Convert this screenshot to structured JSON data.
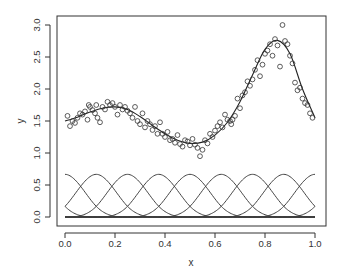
{
  "chart_data": {
    "type": "scatter",
    "title": "",
    "xlabel": "x",
    "ylabel": "y",
    "xlim": [
      -0.03,
      1.04
    ],
    "ylim": [
      -0.14,
      3.14
    ],
    "grid": false,
    "legend": null,
    "x_ticks": [
      "0.0",
      "0.2",
      "0.4",
      "0.6",
      "0.8",
      "1.0"
    ],
    "y_ticks": [
      "0.0",
      "0.5",
      "1.0",
      "1.5",
      "2.0",
      "2.5",
      "3.0"
    ],
    "points": [
      [
        0.01,
        1.58
      ],
      [
        0.02,
        1.42
      ],
      [
        0.03,
        1.5
      ],
      [
        0.04,
        1.47
      ],
      [
        0.05,
        1.55
      ],
      [
        0.06,
        1.62
      ],
      [
        0.07,
        1.6
      ],
      [
        0.08,
        1.65
      ],
      [
        0.09,
        1.52
      ],
      [
        0.095,
        1.75
      ],
      [
        0.1,
        1.72
      ],
      [
        0.11,
        1.67
      ],
      [
        0.12,
        1.62
      ],
      [
        0.125,
        1.75
      ],
      [
        0.13,
        1.55
      ],
      [
        0.14,
        1.48
      ],
      [
        0.15,
        1.72
      ],
      [
        0.16,
        1.68
      ],
      [
        0.17,
        1.8
      ],
      [
        0.18,
        1.75
      ],
      [
        0.19,
        1.78
      ],
      [
        0.2,
        1.72
      ],
      [
        0.21,
        1.6
      ],
      [
        0.22,
        1.75
      ],
      [
        0.23,
        1.68
      ],
      [
        0.24,
        1.72
      ],
      [
        0.25,
        1.66
      ],
      [
        0.26,
        1.62
      ],
      [
        0.27,
        1.55
      ],
      [
        0.28,
        1.72
      ],
      [
        0.29,
        1.5
      ],
      [
        0.3,
        1.45
      ],
      [
        0.31,
        1.62
      ],
      [
        0.32,
        1.4
      ],
      [
        0.33,
        1.5
      ],
      [
        0.34,
        1.45
      ],
      [
        0.35,
        1.36
      ],
      [
        0.36,
        1.42
      ],
      [
        0.37,
        1.3
      ],
      [
        0.38,
        1.48
      ],
      [
        0.39,
        1.3
      ],
      [
        0.4,
        1.25
      ],
      [
        0.41,
        1.33
      ],
      [
        0.42,
        1.2
      ],
      [
        0.43,
        1.22
      ],
      [
        0.44,
        1.16
      ],
      [
        0.45,
        1.28
      ],
      [
        0.46,
        1.14
      ],
      [
        0.47,
        1.1
      ],
      [
        0.48,
        1.2
      ],
      [
        0.49,
        1.18
      ],
      [
        0.5,
        1.12
      ],
      [
        0.51,
        1.22
      ],
      [
        0.52,
        1.13
      ],
      [
        0.53,
        1.08
      ],
      [
        0.54,
        0.95
      ],
      [
        0.55,
        1.05
      ],
      [
        0.56,
        1.2
      ],
      [
        0.57,
        1.15
      ],
      [
        0.58,
        1.3
      ],
      [
        0.59,
        1.25
      ],
      [
        0.6,
        1.35
      ],
      [
        0.61,
        1.42
      ],
      [
        0.62,
        1.48
      ],
      [
        0.63,
        1.4
      ],
      [
        0.64,
        1.6
      ],
      [
        0.65,
        1.52
      ],
      [
        0.66,
        1.5
      ],
      [
        0.665,
        1.45
      ],
      [
        0.67,
        1.52
      ],
      [
        0.68,
        1.58
      ],
      [
        0.69,
        1.85
      ],
      [
        0.7,
        1.7
      ],
      [
        0.71,
        1.9
      ],
      [
        0.72,
        1.95
      ],
      [
        0.73,
        2.12
      ],
      [
        0.74,
        2.05
      ],
      [
        0.75,
        2.15
      ],
      [
        0.76,
        2.3
      ],
      [
        0.77,
        2.45
      ],
      [
        0.78,
        2.2
      ],
      [
        0.79,
        2.38
      ],
      [
        0.8,
        2.55
      ],
      [
        0.81,
        2.6
      ],
      [
        0.82,
        2.7
      ],
      [
        0.83,
        2.52
      ],
      [
        0.84,
        2.78
      ],
      [
        0.85,
        2.68
      ],
      [
        0.86,
        2.35
      ],
      [
        0.87,
        3.0
      ],
      [
        0.88,
        2.75
      ],
      [
        0.89,
        2.7
      ],
      [
        0.9,
        2.52
      ],
      [
        0.91,
        2.4
      ],
      [
        0.92,
        2.1
      ],
      [
        0.93,
        1.98
      ],
      [
        0.94,
        2.02
      ],
      [
        0.95,
        1.85
      ],
      [
        0.96,
        1.78
      ],
      [
        0.97,
        1.75
      ],
      [
        0.98,
        1.62
      ],
      [
        0.99,
        1.55
      ]
    ],
    "fit_curve": {
      "x": [
        0.0,
        0.05,
        0.1,
        0.15,
        0.2,
        0.25,
        0.3,
        0.35,
        0.4,
        0.45,
        0.5,
        0.55,
        0.6,
        0.65,
        0.7,
        0.75,
        0.8,
        0.85,
        0.9,
        0.95,
        1.0
      ],
      "y": [
        1.5,
        1.56,
        1.64,
        1.7,
        1.72,
        1.68,
        1.57,
        1.43,
        1.3,
        1.2,
        1.15,
        1.17,
        1.28,
        1.48,
        1.8,
        2.22,
        2.62,
        2.76,
        2.55,
        2.0,
        1.55
      ]
    },
    "basis_functions": {
      "type": "periodic cubic B-spline",
      "knots": [
        0.0,
        0.125,
        0.25,
        0.375,
        0.5,
        0.625,
        0.75,
        0.875,
        1.0
      ],
      "peak_value": 0.667,
      "count": 8
    }
  }
}
